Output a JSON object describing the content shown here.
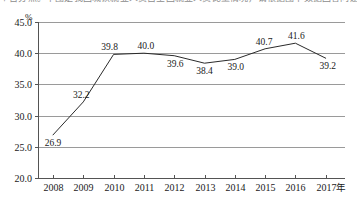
{
  "clipped_header": {
    "text": "个百分点。下图是我国城镇就业人员占全国就业人员比重情况，请根据图中数据回答问题。"
  },
  "chart_data": {
    "type": "line",
    "title": "",
    "xlabel": "年",
    "ylabel": "%",
    "unit_label": "%",
    "x_axis_suffix": "年",
    "categories": [
      "2008",
      "2009",
      "2010",
      "2011",
      "2012",
      "2013",
      "2014",
      "2015",
      "2016",
      "2017"
    ],
    "values": [
      26.9,
      32.2,
      39.8,
      40.0,
      39.6,
      38.4,
      39.0,
      40.7,
      41.6,
      39.2
    ],
    "point_labels": [
      "26.9",
      "32.2",
      "39.8",
      "40.0",
      "39.6",
      "38.4",
      "39.0",
      "40.7",
      "41.6",
      "39.2"
    ],
    "ylim": [
      20.0,
      45.0
    ],
    "ytick_labels": [
      "45.0",
      "40.0",
      "35.0",
      "30.0",
      "25.0",
      "20.0"
    ],
    "ytick_values": [
      45.0,
      40.0,
      35.0,
      30.0,
      25.0,
      20.0
    ],
    "grid": true,
    "grid_axis": "y",
    "legend": false,
    "legend_position": "none",
    "colors": {
      "line": "#2a2a2a",
      "grid": "#9a9a9a",
      "axis": "#545454",
      "text": "#1a1a1a",
      "background": "#ffffff"
    }
  }
}
